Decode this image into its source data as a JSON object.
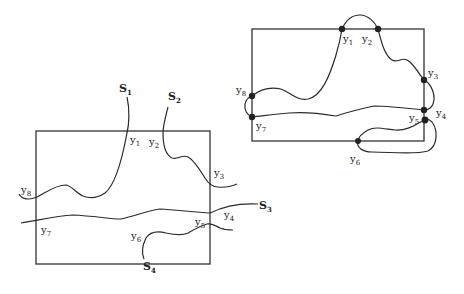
{
  "left_diagram": {
    "description": "Rectangle with four boundary-crossing curves",
    "curves": [
      {
        "name": "S",
        "sub": "1"
      },
      {
        "name": "S",
        "sub": "2"
      },
      {
        "name": "S",
        "sub": "3"
      },
      {
        "name": "S",
        "sub": "4"
      }
    ],
    "points": [
      {
        "name": "y",
        "sub": "1"
      },
      {
        "name": "y",
        "sub": "2"
      },
      {
        "name": "y",
        "sub": "3"
      },
      {
        "name": "y",
        "sub": "4"
      },
      {
        "name": "y",
        "sub": "5"
      },
      {
        "name": "y",
        "sub": "6"
      },
      {
        "name": "y",
        "sub": "7"
      },
      {
        "name": "y",
        "sub": "8"
      }
    ]
  },
  "right_diagram": {
    "description": "Rectangle with boundary points y1..y8 connected by outside arcs",
    "points": [
      {
        "name": "y",
        "sub": "1"
      },
      {
        "name": "y",
        "sub": "2"
      },
      {
        "name": "y",
        "sub": "3"
      },
      {
        "name": "y",
        "sub": "4"
      },
      {
        "name": "y",
        "sub": "5"
      },
      {
        "name": "y",
        "sub": "6"
      },
      {
        "name": "y",
        "sub": "7"
      },
      {
        "name": "y",
        "sub": "8"
      }
    ]
  }
}
